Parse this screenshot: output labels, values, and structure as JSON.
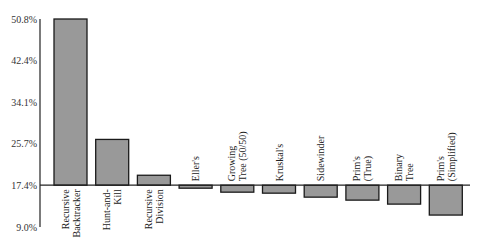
{
  "chart_data": {
    "type": "bar",
    "title": "",
    "xlabel": "",
    "ylabel": "",
    "baseline": 17.4,
    "ylim": [
      9.0,
      50.8
    ],
    "yticks": [
      "50.8%",
      "42.4%",
      "34.1%",
      "25.7%",
      "17.4%",
      "9.0%"
    ],
    "ytick_values": [
      50.8,
      42.4,
      34.1,
      25.7,
      17.4,
      9.0
    ],
    "grid": false,
    "legend": null,
    "categories": [
      [
        "Recursive",
        "Backtracker"
      ],
      [
        "Hunt-and-",
        "Kill"
      ],
      [
        "Recursive",
        "Division"
      ],
      [
        "Eller's"
      ],
      [
        "Growing",
        "Tree (50/50)"
      ],
      [
        "Kruskal's"
      ],
      [
        "Sidewinder"
      ],
      [
        "Prim's",
        "(True)"
      ],
      [
        "Binary",
        "Tree"
      ],
      [
        "Prim's",
        "(Simplified)"
      ]
    ],
    "category_names": [
      "Recursive Backtracker",
      "Hunt-and-Kill",
      "Recursive Division",
      "Eller's",
      "Growing Tree (50/50)",
      "Kruskal's",
      "Sidewinder",
      "Prim's (True)",
      "Binary Tree",
      "Prim's (Simplified)"
    ],
    "values": [
      50.8,
      26.6,
      19.4,
      16.8,
      16.0,
      15.8,
      15.0,
      14.4,
      13.6,
      11.4
    ],
    "colors": {
      "bar_fill": "#999999",
      "bar_stroke": "#1a1a1a",
      "axis": "#222222"
    }
  }
}
